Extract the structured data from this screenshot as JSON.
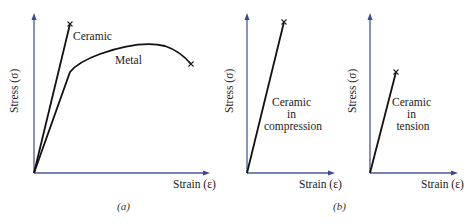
{
  "figure": {
    "panels": [
      {
        "id": "a",
        "caption": "(a)",
        "y_axis_label": "Stress (σ)",
        "x_axis_label": "Strain (ε)",
        "curves": [
          {
            "name": "Ceramic",
            "label": "Ceramic",
            "type": "linear",
            "fracture_mark": "×"
          },
          {
            "name": "Metal",
            "label": "Metal",
            "type": "elastic-plastic",
            "fracture_mark": "×"
          }
        ]
      },
      {
        "id": "b1",
        "y_axis_label": "Stress (σ)",
        "x_axis_label": "Strain (ε)",
        "curves": [
          {
            "name": "Ceramic in compression",
            "label_lines": [
              "Ceramic",
              "in",
              "compression"
            ],
            "type": "linear",
            "fracture_mark": "×"
          }
        ]
      },
      {
        "id": "b2",
        "y_axis_label": "Stress (σ)",
        "x_axis_label": "Strain (ε)",
        "curves": [
          {
            "name": "Ceramic in tension",
            "label_lines": [
              "Ceramic",
              "in",
              "tension"
            ],
            "type": "linear",
            "fracture_mark": "×"
          }
        ]
      }
    ],
    "caption_b": "(b)"
  },
  "colors": {
    "axis": "#4a5a9a",
    "curve": "#111111"
  }
}
